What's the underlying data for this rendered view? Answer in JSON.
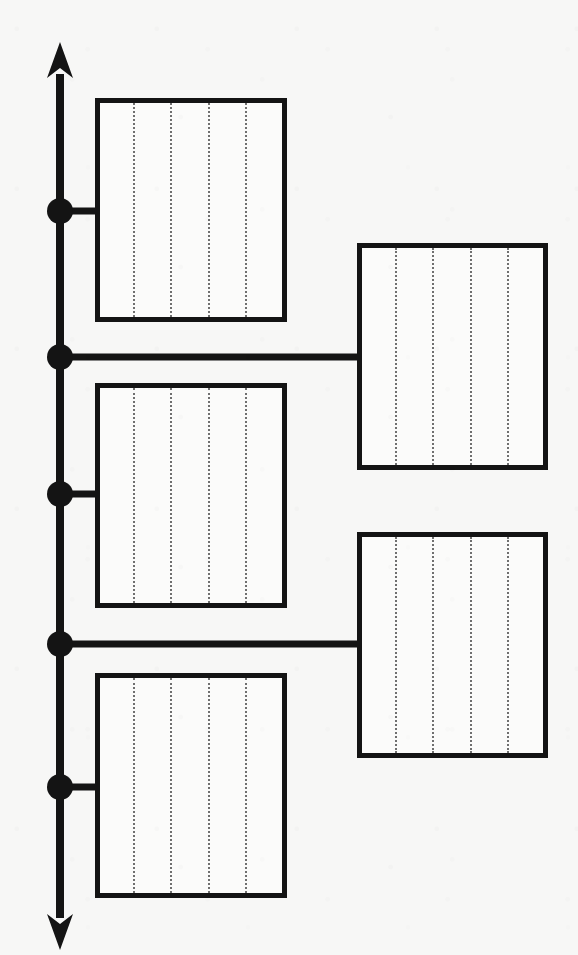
{
  "figure": {
    "canvas": {
      "width": 578,
      "height": 955
    },
    "background_color": "#f7f7f6",
    "ink_color": "#141414",
    "box_fill_color": "#fbfbfa",
    "stripe_color": "#6f6f6f"
  },
  "axis": {
    "name": "vertical-axis",
    "x": 60,
    "top_y": 42,
    "bottom_y": 950,
    "stroke_width": 8,
    "arrow_head_top": "up-arrowhead",
    "arrow_head_bottom": "down-arrowhead",
    "arrow_head_width": 26,
    "arrow_head_length": 36
  },
  "nodes": [
    {
      "id": "node-1",
      "label": "1",
      "x": 60,
      "y": 211,
      "radius": 13
    },
    {
      "id": "node-2",
      "label": "2",
      "x": 60,
      "y": 357,
      "radius": 13
    },
    {
      "id": "node-3",
      "label": "3",
      "x": 60,
      "y": 494,
      "radius": 13
    },
    {
      "id": "node-4",
      "label": "4",
      "x": 60,
      "y": 644,
      "radius": 13
    },
    {
      "id": "node-5",
      "label": "5",
      "x": 60,
      "y": 787,
      "radius": 13
    }
  ],
  "connectors": [
    {
      "id": "connector-1",
      "from_node": "node-1",
      "to_box": "box-left-1",
      "y": 211,
      "x1": 60,
      "x2": 96,
      "stroke_width": 7
    },
    {
      "id": "connector-2",
      "from_node": "node-2",
      "to_box": "box-right-1",
      "y": 357,
      "x1": 60,
      "x2": 359,
      "stroke_width": 7
    },
    {
      "id": "connector-3",
      "from_node": "node-3",
      "to_box": "box-left-2",
      "y": 494,
      "x1": 60,
      "x2": 96,
      "stroke_width": 7
    },
    {
      "id": "connector-4",
      "from_node": "node-4",
      "to_box": "box-right-2",
      "y": 644,
      "x1": 60,
      "x2": 359,
      "stroke_width": 7
    },
    {
      "id": "connector-5",
      "from_node": "node-5",
      "to_box": "box-left-3",
      "y": 787,
      "x1": 60,
      "x2": 96,
      "stroke_width": 7
    }
  ],
  "boxes": [
    {
      "id": "box-left-1",
      "name": "block-left-upper",
      "column": "left",
      "x": 95,
      "y": 98,
      "width": 192,
      "height": 224,
      "border_width": 5,
      "stripes": 4,
      "stripe_positions": [
        33,
        37,
        38,
        37
      ],
      "stripe_width": 2
    },
    {
      "id": "box-right-1",
      "name": "block-right-upper",
      "column": "right",
      "x": 357,
      "y": 243,
      "width": 191,
      "height": 227,
      "border_width": 5,
      "stripes": 4,
      "stripe_positions": [
        33,
        37,
        38,
        37
      ],
      "stripe_width": 2
    },
    {
      "id": "box-left-2",
      "name": "block-left-middle",
      "column": "left",
      "x": 95,
      "y": 383,
      "width": 192,
      "height": 225,
      "border_width": 5,
      "stripes": 4,
      "stripe_positions": [
        33,
        37,
        38,
        37
      ],
      "stripe_width": 2
    },
    {
      "id": "box-right-2",
      "name": "block-right-lower",
      "column": "right",
      "x": 357,
      "y": 532,
      "width": 191,
      "height": 226,
      "border_width": 5,
      "stripes": 4,
      "stripe_positions": [
        33,
        37,
        38,
        37
      ],
      "stripe_width": 2
    },
    {
      "id": "box-left-3",
      "name": "block-left-lower",
      "column": "left",
      "x": 95,
      "y": 673,
      "width": 192,
      "height": 225,
      "border_width": 5,
      "stripes": 4,
      "stripe_positions": [
        33,
        37,
        38,
        37
      ],
      "stripe_width": 2
    }
  ]
}
